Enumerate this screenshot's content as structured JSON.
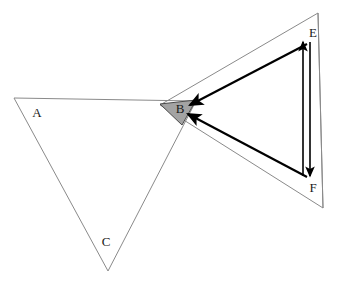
{
  "figure": {
    "title": "",
    "background_color": "#ffffff",
    "width": 337,
    "height": 286
  },
  "colors": {
    "thin_outline": "#8a8a8a",
    "thick_arrow": "#000000",
    "shaded_fill": "#a3a3a3",
    "shaded_stroke": "#4a4a4a",
    "label_text": "#1a1a1a"
  },
  "labels": {
    "a": "A",
    "b": "B",
    "c": "C",
    "e": "E",
    "f": "F"
  },
  "label_positions": {
    "a": {
      "x": 37,
      "y": 117
    },
    "b": {
      "x": 180,
      "y": 113
    },
    "c": {
      "x": 106,
      "y": 246
    },
    "e": {
      "x": 313,
      "y": 37
    },
    "f": {
      "x": 313,
      "y": 192
    }
  },
  "shapes": {
    "left_triangle": {
      "name": "triangle-ABC",
      "points": "14,98 196,101 108,271",
      "stroke": "#8a8a8a",
      "stroke_width": 1,
      "fill": "none"
    },
    "right_triangle": {
      "name": "triangle-EBF",
      "points": "318,13 160,105 323,208",
      "stroke": "#8a8a8a",
      "stroke_width": 1,
      "fill": "none"
    },
    "right_triangle_edge": {
      "name": "segment-EF-outer",
      "x1": 318,
      "y1": 13,
      "x2": 323,
      "y2": 208,
      "stroke": "#8a8a8a",
      "stroke_width": 1
    },
    "shaded_triangle": {
      "name": "shaded-region-B",
      "points": "160,104 196,100 182,125",
      "fill": "#a3a3a3",
      "stroke": "#4a4a4a",
      "stroke_width": 1
    }
  },
  "arrows": {
    "e_to_b": {
      "name": "arrow-E-to-B",
      "x1": 307,
      "y1": 44,
      "x2": 190,
      "y2": 105,
      "stroke": "#000000",
      "stroke_width": 2.2,
      "head": "end"
    },
    "f_to_b": {
      "name": "arrow-F-to-B",
      "x1": 307,
      "y1": 177,
      "x2": 188,
      "y2": 114,
      "stroke": "#000000",
      "stroke_width": 2.2,
      "head": "end"
    },
    "f_to_e_up": {
      "name": "arrow-F-to-E-upward",
      "x1": 303,
      "y1": 176,
      "x2": 303,
      "y2": 42,
      "stroke": "#000000",
      "stroke_width": 1.6,
      "head": "end"
    },
    "e_to_f_down": {
      "name": "arrow-E-to-F-downward",
      "x1": 310,
      "y1": 42,
      "x2": 310,
      "y2": 176,
      "stroke": "#000000",
      "stroke_width": 1.6,
      "head": "end"
    }
  }
}
